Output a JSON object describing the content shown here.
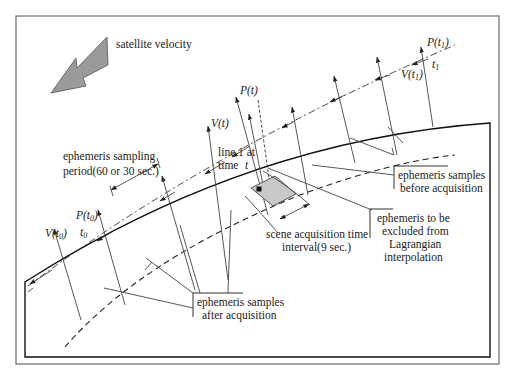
{
  "figure": {
    "labels": {
      "satellite_velocity": "satellite velocity",
      "sampling_period_line1": "ephemeris sampling",
      "sampling_period_line2": "period(60 or 30 sec.)",
      "line1_at_line1": "line 1 at",
      "line1_at_line2": "time",
      "time_t": "t",
      "P_t": "P(t)",
      "V_t": "V(t)",
      "P_t0": "P(t",
      "V_t0": "V(t",
      "t0": "t",
      "P_t1": "P(t",
      "V_t1": "V(t",
      "t1": "t",
      "sub0": "0",
      "sub1": "1",
      "close_paren": ")",
      "samples_before_line1": "ephemeris samples",
      "samples_before_line2": "before acquisition",
      "samples_after_line1": "ephemeris samples",
      "samples_after_line2": "after acquisition",
      "scene_interval_line1": "scene acquisition time",
      "scene_interval_line2": "interval(9 sec.)",
      "excluded_line1": "ephemeris to be",
      "excluded_line2": "excluded from",
      "excluded_line3": "Lagrangian",
      "excluded_line4": "interpolation"
    },
    "colors": {
      "arrow_fill": "#9a9a9a",
      "scene_fill": "#c8c8c8",
      "frame": "#777777",
      "line": "#222222"
    }
  }
}
